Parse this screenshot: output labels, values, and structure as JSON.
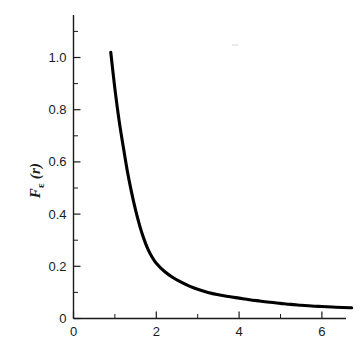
{
  "chart_data": {
    "type": "line",
    "title": "",
    "subtitle": "",
    "xlabel": "",
    "ylabel": "F_epsilon (r)",
    "ylabel_parts": {
      "base": "F",
      "subscript": "ε",
      "argument": " (r)"
    },
    "xlim": [
      0,
      6.72
    ],
    "ylim": [
      0,
      1.17
    ],
    "grid": false,
    "legend": null,
    "x_ticks_major": [
      0,
      2,
      4,
      6
    ],
    "x_tick_labels": [
      "0",
      "2",
      "4",
      "6"
    ],
    "x_ticks_minor": [
      1,
      3,
      5
    ],
    "y_ticks_major": [
      0,
      0.2,
      0.4,
      0.6,
      0.8,
      1.0
    ],
    "y_tick_labels": [
      "0",
      "0.2",
      "0.4",
      "0.6",
      "0.8",
      "1.0"
    ],
    "y_ticks_minor": [
      0.1,
      0.3,
      0.5,
      0.7,
      0.9,
      1.1
    ],
    "series": [
      {
        "name": "F_epsilon(r)",
        "color": "#000000",
        "x": [
          0.9,
          1.0,
          1.1,
          1.2,
          1.3,
          1.4,
          1.5,
          1.6,
          1.7,
          1.8,
          1.9,
          2.0,
          2.2,
          2.4,
          2.6,
          2.8,
          3.0,
          3.25,
          3.5,
          3.75,
          4.0,
          4.25,
          4.5,
          4.75,
          5.0,
          5.25,
          5.5,
          5.75,
          6.0,
          6.25,
          6.5,
          6.72
        ],
        "values": [
          1.02,
          0.88,
          0.76,
          0.66,
          0.565,
          0.485,
          0.415,
          0.355,
          0.305,
          0.265,
          0.235,
          0.212,
          0.18,
          0.157,
          0.139,
          0.124,
          0.112,
          0.1,
          0.091,
          0.084,
          0.078,
          0.072,
          0.067,
          0.062,
          0.058,
          0.054,
          0.051,
          0.048,
          0.046,
          0.044,
          0.042,
          0.041
        ]
      }
    ]
  },
  "axes": {
    "x_axis_name": "horizontal-axis",
    "y_axis_name": "vertical-axis"
  },
  "colors": {
    "background": "#ffffff",
    "axis": "#1a1a1a",
    "curve": "#000000"
  }
}
